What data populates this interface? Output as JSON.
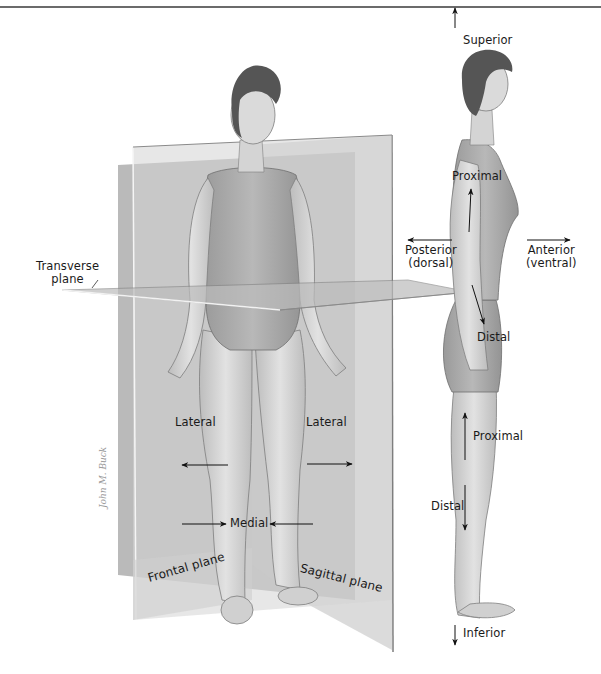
{
  "figure": {
    "header_rule": true
  },
  "planes": {
    "transverse": "Transverse\nplane",
    "transverse_line1": "Transverse",
    "transverse_line2": "plane",
    "frontal": "Frontal plane",
    "sagittal": "Sagittal plane"
  },
  "directions": {
    "superior": "Superior",
    "inferior": "Inferior",
    "posterior": "Posterior",
    "posterior_alt": "(dorsal)",
    "anterior": "Anterior",
    "anterior_alt": "(ventral)",
    "proximal_arm": "Proximal",
    "distal_arm": "Distal",
    "proximal_leg": "Proximal",
    "distal_leg": "Distal",
    "lateral_left": "Lateral",
    "lateral_right": "Lateral",
    "medial": "Medial"
  },
  "signature": "John M. Buck",
  "colors": {
    "plane_dark": "#9c9c9c",
    "plane_light": "#c9c9c9",
    "plane_edge": "#7a7a7a",
    "skin": "#d8d8d8",
    "skin_shade": "#b5b5b5",
    "suit": "#a9a9a9",
    "hair": "#4a4a4a",
    "arrow": "#111111"
  }
}
